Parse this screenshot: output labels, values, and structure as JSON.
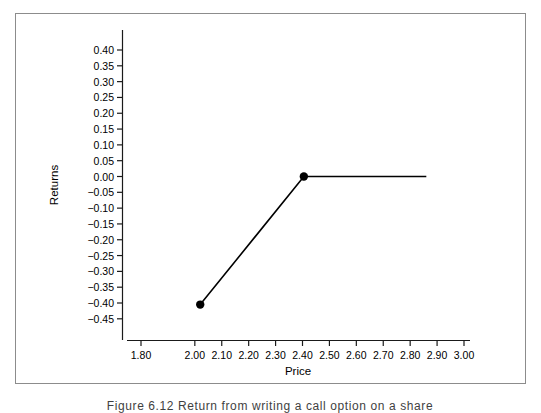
{
  "figure": {
    "caption": "Figure 6.12   Return from writing a call option on a share"
  },
  "chart_data": {
    "type": "line",
    "title": "",
    "subtitle": "",
    "xlabel": "Price",
    "ylabel": "Returns",
    "xlim": [
      1.74,
      3.06
    ],
    "ylim": [
      -0.48,
      0.435
    ],
    "grid": false,
    "legend": null,
    "xticks": [
      "1.80",
      "2.00",
      "2.10",
      "2.20",
      "2.30",
      "2.40",
      "2.50",
      "2.60",
      "2.70",
      "2.80",
      "2.90",
      "3.00"
    ],
    "xtick_values": [
      1.8,
      2.0,
      2.1,
      2.2,
      2.3,
      2.4,
      2.5,
      2.6,
      2.7,
      2.8,
      2.9,
      3.0
    ],
    "yticks": [
      "0.40",
      "0.35",
      "0.30",
      "0.25",
      "0.20",
      "0.15",
      "0.10",
      "0.05",
      "0.00",
      "−0.05",
      "−0.10",
      "−0.15",
      "−0.20",
      "−0.25",
      "−0.30",
      "−0.35",
      "−0.40",
      "−0.45"
    ],
    "ytick_values": [
      0.4,
      0.35,
      0.3,
      0.25,
      0.2,
      0.15,
      0.1,
      0.05,
      0.0,
      -0.05,
      -0.1,
      -0.15,
      -0.2,
      -0.25,
      -0.3,
      -0.35,
      -0.4,
      -0.45
    ],
    "series": [
      {
        "name": "Returns",
        "color": "#000000",
        "line_width": 1.6,
        "x": [
          2.02,
          2.405,
          2.86
        ],
        "y": [
          -0.405,
          0.0,
          0.0
        ],
        "markers": [
          {
            "x": 2.02,
            "y": -0.405,
            "shape": "filled-circle",
            "radius": 4.2
          },
          {
            "x": 2.405,
            "y": 0.0,
            "shape": "filled-circle",
            "radius": 4.2
          }
        ]
      }
    ],
    "axis_color": "#1a1a1a",
    "frame_color": "#8c8c8c",
    "background": "#ffffff"
  }
}
